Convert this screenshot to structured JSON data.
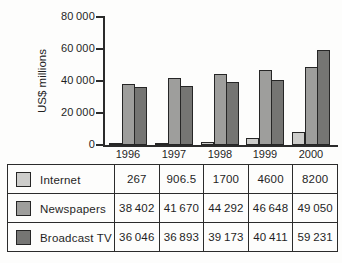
{
  "chart": {
    "ylabel": "US$ millions",
    "y_ticks": [
      "80 000",
      "60 000",
      "40 000",
      "20 000",
      "0"
    ]
  },
  "chart_data": {
    "type": "bar",
    "categories": [
      "1996",
      "1997",
      "1998",
      "1999",
      "2000"
    ],
    "series": [
      {
        "name": "Internet",
        "values": [
          267,
          906.5,
          1700,
          4600,
          8200
        ],
        "color": "#cdcdcb"
      },
      {
        "name": "Newspapers",
        "values": [
          38402,
          41670,
          44292,
          46648,
          49050
        ],
        "color": "#9e9e9c"
      },
      {
        "name": "Broadcast TV",
        "values": [
          36046,
          36893,
          39173,
          40411,
          59231
        ],
        "color": "#757573"
      }
    ],
    "title": "",
    "xlabel": "",
    "ylabel": "US$ millions",
    "ylim": [
      0,
      80000
    ],
    "grid": false,
    "legend_position": "table-below"
  },
  "table": {
    "rows": [
      {
        "label": "Internet",
        "values": [
          "267",
          "906.5",
          "1700",
          "4600",
          "8200"
        ]
      },
      {
        "label": "Newspapers",
        "values": [
          "38 402",
          "41 670",
          "44 292",
          "46 648",
          "49 050"
        ]
      },
      {
        "label": "Broadcast TV",
        "values": [
          "36 046",
          "36 893",
          "39 173",
          "40 411",
          "59 231"
        ]
      }
    ]
  }
}
